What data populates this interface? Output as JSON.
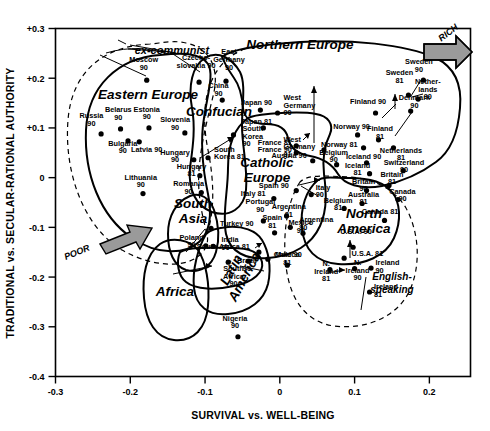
{
  "chart_data": {
    "type": "scatter",
    "title": "",
    "xlabel": "SURVIVAL vs. WELL-BEING",
    "ylabel": "TRADITIONAL vs. SECULAR-RATIONAL AUTHORITY",
    "xlim": [
      -0.3,
      0.255
    ],
    "ylim": [
      -0.4,
      0.3
    ],
    "grid": false,
    "legend": "none",
    "xticks": [
      "-0.3",
      "-0.2",
      "-0.1",
      "0",
      "0.1",
      "0.2"
    ],
    "xtick_values": [
      -0.3,
      -0.2,
      -0.1,
      0,
      0.1,
      0.2
    ],
    "yticks": [
      "+0.3",
      "+0.2",
      "+0.1",
      "0",
      "-0.1",
      "-0.2",
      "-0.3",
      "-0.4"
    ],
    "ytick_values": [
      0.3,
      0.2,
      0.1,
      0,
      -0.1,
      -0.2,
      -0.3,
      -0.4
    ],
    "annotations": [
      {
        "name": "rich-arrow-label",
        "text": "RICH",
        "x": 0.225,
        "y": 0.255
      },
      {
        "name": "poor-arrow-label",
        "text": "POOR",
        "x": -0.255,
        "y": -0.205
      }
    ],
    "clusters": [
      {
        "name": "ex-communist",
        "label": "ex-communist",
        "style": "dashed"
      },
      {
        "name": "eastern-europe",
        "label": "Eastern Europe",
        "style": "solid"
      },
      {
        "name": "confucian",
        "label": "Confucian",
        "style": "solid"
      },
      {
        "name": "northern-europe",
        "label": "Northern Europe",
        "style": "solid"
      },
      {
        "name": "catholic-europe",
        "label": "Catholic\nEurope",
        "style": "solid"
      },
      {
        "name": "south-asia",
        "label": "South\nAsia",
        "style": "solid"
      },
      {
        "name": "africa",
        "label": "Africa",
        "style": "solid"
      },
      {
        "name": "latin-america",
        "label": "Latin\nAmerica",
        "style": "solid"
      },
      {
        "name": "north-america",
        "label": "North\nAmerica",
        "style": "solid"
      },
      {
        "name": "english-speaking",
        "label": "English-\nspeaking",
        "style": "dashed"
      }
    ],
    "points": [
      {
        "label": "Moscow\n90",
        "x": -0.178,
        "y": 0.196,
        "lx": -0.182,
        "ly": 0.232,
        "anchor": "middle"
      },
      {
        "label": "Czecho-\nslovakia 90",
        "x": -0.108,
        "y": 0.192,
        "lx": -0.112,
        "ly": 0.236,
        "anchor": "middle"
      },
      {
        "label": "East\nGermany\n90",
        "x": -0.072,
        "y": 0.194,
        "lx": -0.068,
        "ly": 0.248,
        "anchor": "middle"
      },
      {
        "label": "China\n90",
        "x": -0.077,
        "y": 0.156,
        "lx": -0.082,
        "ly": 0.18,
        "anchor": "middle"
      },
      {
        "label": "Japan 90",
        "x": -0.026,
        "y": 0.136,
        "lx": -0.052,
        "ly": 0.146,
        "anchor": "start"
      },
      {
        "label": "Japan 81",
        "x": -0.022,
        "y": 0.1,
        "lx": -0.052,
        "ly": 0.107,
        "anchor": "start"
      },
      {
        "label": "Belarus\n90",
        "x": -0.213,
        "y": 0.098,
        "lx": -0.216,
        "ly": 0.132,
        "anchor": "middle"
      },
      {
        "label": "Russia\n90",
        "x": -0.239,
        "y": 0.088,
        "lx": -0.252,
        "ly": 0.12,
        "anchor": "middle"
      },
      {
        "label": "Estonia\n90",
        "x": -0.175,
        "y": 0.1,
        "lx": -0.178,
        "ly": 0.133,
        "anchor": "middle"
      },
      {
        "label": "Bulgaria\n90",
        "x": -0.203,
        "y": 0.074,
        "lx": -0.21,
        "ly": 0.064,
        "anchor": "middle"
      },
      {
        "label": "Latvia 90",
        "x": -0.188,
        "y": 0.072,
        "lx": -0.178,
        "ly": 0.052,
        "anchor": "middle"
      },
      {
        "label": "Slovenia\n90",
        "x": -0.127,
        "y": 0.09,
        "lx": -0.14,
        "ly": 0.112,
        "anchor": "middle"
      },
      {
        "label": "South\nKorea\n90",
        "x": -0.062,
        "y": 0.086,
        "lx": -0.05,
        "ly": 0.094,
        "anchor": "start"
      },
      {
        "label": "South\nKorea 81",
        "x": -0.096,
        "y": 0.04,
        "lx": -0.088,
        "ly": 0.052,
        "anchor": "start"
      },
      {
        "label": "Hungary\n90",
        "x": -0.115,
        "y": 0.036,
        "lx": -0.14,
        "ly": 0.046,
        "anchor": "middle"
      },
      {
        "label": "Hungary\n81",
        "x": -0.107,
        "y": 0.004,
        "lx": -0.118,
        "ly": 0.018,
        "anchor": "middle"
      },
      {
        "label": "Romania\n90",
        "x": -0.105,
        "y": -0.03,
        "lx": -0.122,
        "ly": -0.017,
        "anchor": "middle"
      },
      {
        "label": "Lithuania\n90",
        "x": -0.183,
        "y": -0.032,
        "lx": -0.186,
        "ly": -0.004,
        "anchor": "middle"
      },
      {
        "label": "Turkey 90",
        "x": -0.092,
        "y": -0.102,
        "lx": -0.08,
        "ly": -0.098,
        "anchor": "start"
      },
      {
        "label": "Poland\n90",
        "x": -0.099,
        "y": -0.137,
        "lx": -0.118,
        "ly": -0.125,
        "anchor": "middle"
      },
      {
        "label": "India\n90",
        "x": -0.089,
        "y": -0.138,
        "lx": -0.078,
        "ly": -0.13,
        "anchor": "start"
      },
      {
        "label": "Italy 81",
        "x": -0.008,
        "y": -0.042,
        "lx": -0.019,
        "ly": -0.036,
        "anchor": "end"
      },
      {
        "label": "Italy\n90",
        "x": 0.042,
        "y": -0.034,
        "lx": 0.048,
        "ly": -0.024,
        "anchor": "start"
      },
      {
        "label": "Portugal\n90",
        "x": -0.022,
        "y": -0.087,
        "lx": -0.026,
        "ly": -0.054,
        "anchor": "middle"
      },
      {
        "label": "Spain\n81",
        "x": -0.007,
        "y": -0.111,
        "lx": -0.01,
        "ly": -0.086,
        "anchor": "middle"
      },
      {
        "label": "Spain 90",
        "x": 0.022,
        "y": -0.026,
        "lx": 0.012,
        "ly": -0.02,
        "anchor": "end"
      },
      {
        "label": "Argentina\n81",
        "x": 0.009,
        "y": -0.077,
        "lx": 0.012,
        "ly": -0.064,
        "anchor": "middle"
      },
      {
        "label": "Argentina\n90",
        "x": 0.014,
        "y": -0.1,
        "lx": 0.026,
        "ly": -0.09,
        "anchor": "start"
      },
      {
        "label": "Mexico\n90",
        "x": 0.031,
        "y": -0.112,
        "lx": 0.028,
        "ly": -0.096,
        "anchor": "middle"
      },
      {
        "label": "Mexico\n81",
        "x": 0.01,
        "y": -0.176,
        "lx": 0.01,
        "ly": -0.16,
        "anchor": "middle"
      },
      {
        "label": "Chile 90",
        "x": -0.016,
        "y": -0.164,
        "lx": -0.008,
        "ly": -0.16,
        "anchor": "start"
      },
      {
        "label": "Brazil\n90",
        "x": -0.042,
        "y": -0.168,
        "lx": -0.044,
        "ly": -0.172,
        "anchor": "middle"
      },
      {
        "label": "South\nAfrica\n90",
        "x": -0.069,
        "y": -0.17,
        "lx": -0.062,
        "ly": -0.188,
        "anchor": "middle"
      },
      {
        "label": "South Africa 81",
        "x": -0.028,
        "y": -0.15,
        "lx": -0.04,
        "ly": -0.144,
        "anchor": "end"
      },
      {
        "label": "Nigeria\n90",
        "x": -0.056,
        "y": -0.32,
        "lx": -0.06,
        "ly": -0.288,
        "anchor": "middle"
      },
      {
        "label": "France 81",
        "x": 0.022,
        "y": 0.064,
        "lx": 0.016,
        "ly": 0.066,
        "anchor": "end"
      },
      {
        "label": "France 90",
        "x": 0.022,
        "y": 0.05,
        "lx": 0.016,
        "ly": 0.052,
        "anchor": "end"
      },
      {
        "label": "West\nGermany\n90",
        "x": -0.003,
        "y": 0.13,
        "lx": 0.005,
        "ly": 0.156,
        "anchor": "start"
      },
      {
        "label": "West\nGermany\n81",
        "x": 0.059,
        "y": 0.056,
        "lx": 0.005,
        "ly": 0.072,
        "anchor": "start"
      },
      {
        "label": "Austria 90",
        "x": 0.044,
        "y": 0.034,
        "lx": 0.036,
        "ly": 0.04,
        "anchor": "end"
      },
      {
        "label": "Belgium\n90",
        "x": 0.076,
        "y": 0.026,
        "lx": 0.072,
        "ly": 0.046,
        "anchor": "middle"
      },
      {
        "label": "Belgium\n81",
        "x": 0.086,
        "y": -0.062,
        "lx": 0.078,
        "ly": -0.05,
        "anchor": "middle"
      },
      {
        "label": "Finland 90",
        "x": 0.128,
        "y": 0.13,
        "lx": 0.118,
        "ly": 0.148,
        "anchor": "middle"
      },
      {
        "label": "Finland\n81",
        "x": 0.132,
        "y": 0.076,
        "lx": 0.134,
        "ly": 0.094,
        "anchor": "middle"
      },
      {
        "label": "Sweden\n90",
        "x": 0.192,
        "y": 0.196,
        "lx": 0.186,
        "ly": 0.228,
        "anchor": "middle"
      },
      {
        "label": "Sweden\n81",
        "x": 0.172,
        "y": 0.166,
        "lx": 0.16,
        "ly": 0.206,
        "anchor": "middle"
      },
      {
        "label": "Nether-\nlands\n90",
        "x": 0.185,
        "y": 0.158,
        "lx": 0.198,
        "ly": 0.188,
        "anchor": "middle"
      },
      {
        "label": "Denmark\n90",
        "x": 0.175,
        "y": 0.134,
        "lx": 0.18,
        "ly": 0.156,
        "anchor": "middle"
      },
      {
        "label": "Netherlands\n81",
        "x": 0.152,
        "y": 0.06,
        "lx": 0.162,
        "ly": 0.05,
        "anchor": "middle"
      },
      {
        "label": "Norway 90",
        "x": 0.104,
        "y": 0.086,
        "lx": 0.096,
        "ly": 0.098,
        "anchor": "middle"
      },
      {
        "label": "Norway 81",
        "x": 0.112,
        "y": 0.06,
        "lx": 0.104,
        "ly": 0.062,
        "anchor": "end"
      },
      {
        "label": "Iceland 90",
        "x": 0.116,
        "y": 0.03,
        "lx": 0.112,
        "ly": 0.038,
        "anchor": "middle"
      },
      {
        "label": "Iceland\n81",
        "x": 0.12,
        "y": 0.008,
        "lx": 0.104,
        "ly": 0.02,
        "anchor": "middle"
      },
      {
        "label": "Switzerland\n90",
        "x": 0.165,
        "y": 0.014,
        "lx": 0.166,
        "ly": 0.026,
        "anchor": "middle"
      },
      {
        "label": "Britain\n90",
        "x": 0.116,
        "y": -0.026,
        "lx": 0.112,
        "ly": -0.012,
        "anchor": "middle"
      },
      {
        "label": "Britain\n81",
        "x": 0.146,
        "y": -0.016,
        "lx": 0.15,
        "ly": 0.002,
        "anchor": "middle"
      },
      {
        "label": "Canada\n90",
        "x": 0.158,
        "y": -0.044,
        "lx": 0.164,
        "ly": -0.032,
        "anchor": "middle"
      },
      {
        "label": "Canada 81",
        "x": 0.14,
        "y": -0.086,
        "lx": 0.134,
        "ly": -0.074,
        "anchor": "middle"
      },
      {
        "label": "Australia\n81",
        "x": 0.11,
        "y": -0.052,
        "lx": 0.112,
        "ly": -0.038,
        "anchor": "middle"
      },
      {
        "label": "U.S.A. 90",
        "x": 0.098,
        "y": -0.14,
        "lx": 0.102,
        "ly": -0.114,
        "anchor": "middle"
      },
      {
        "label": "U.S.A. 81",
        "x": 0.086,
        "y": -0.162,
        "lx": 0.096,
        "ly": -0.158,
        "anchor": "start"
      },
      {
        "label": "N.\nIreland\n90",
        "x": 0.1,
        "y": -0.183,
        "lx": 0.104,
        "ly": -0.176,
        "anchor": "middle"
      },
      {
        "label": "N.\nIreland\n81",
        "x": 0.067,
        "y": -0.185,
        "lx": 0.062,
        "ly": -0.178,
        "anchor": "middle"
      },
      {
        "label": "Ireland\n90",
        "x": 0.122,
        "y": -0.182,
        "lx": 0.128,
        "ly": -0.176,
        "anchor": "start"
      },
      {
        "label": "Ireland\n81",
        "x": 0.12,
        "y": -0.23,
        "lx": 0.126,
        "ly": -0.224,
        "anchor": "start"
      }
    ]
  }
}
